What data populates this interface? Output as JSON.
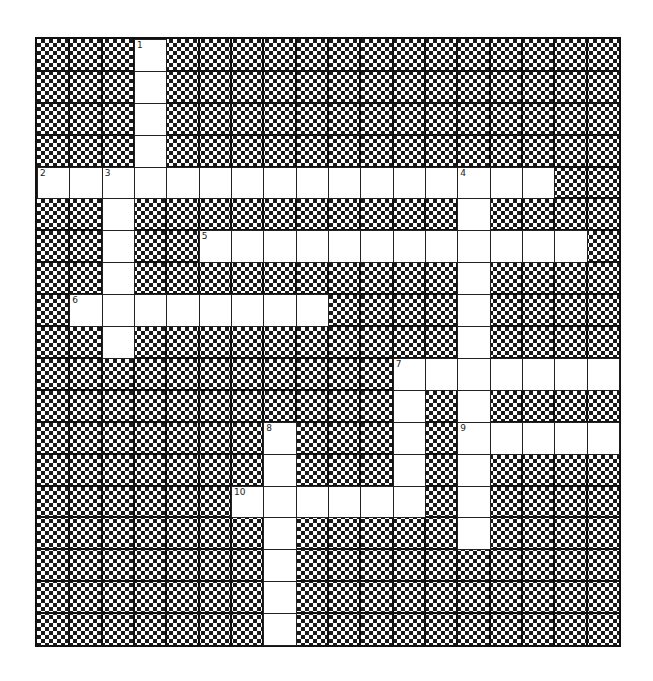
{
  "puzzle": {
    "type": "crossword",
    "cols": 18,
    "rows": 19,
    "colors": {
      "block": "#1a1a1a",
      "cell": "#ffffff",
      "line": "#111111"
    },
    "entries": [
      {
        "number": 1,
        "direction": "down",
        "row": 0,
        "col": 3,
        "length": 5
      },
      {
        "number": 2,
        "direction": "across",
        "row": 4,
        "col": 0,
        "length": 16
      },
      {
        "number": 3,
        "direction": "down",
        "row": 4,
        "col": 2,
        "length": 6
      },
      {
        "number": 4,
        "direction": "down",
        "row": 4,
        "col": 13,
        "length": 12
      },
      {
        "number": 5,
        "direction": "across",
        "row": 6,
        "col": 5,
        "length": 12
      },
      {
        "number": 6,
        "direction": "across",
        "row": 8,
        "col": 1,
        "length": 8
      },
      {
        "number": 7,
        "direction": "across",
        "row": 10,
        "col": 11,
        "length": 7
      },
      {
        "number": 7,
        "direction": "down",
        "row": 10,
        "col": 11,
        "length": 5
      },
      {
        "number": 8,
        "direction": "down",
        "row": 12,
        "col": 7,
        "length": 7
      },
      {
        "number": 9,
        "direction": "across",
        "row": 12,
        "col": 13,
        "length": 5
      },
      {
        "number": 10,
        "direction": "across",
        "row": 14,
        "col": 6,
        "length": 6
      }
    ]
  }
}
